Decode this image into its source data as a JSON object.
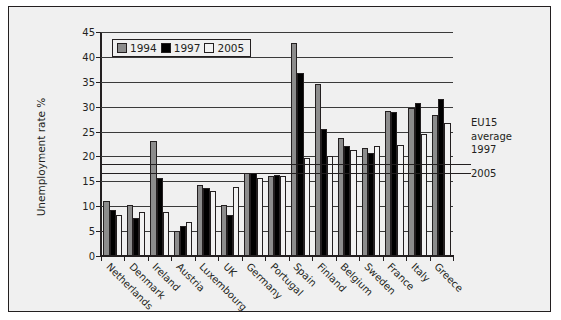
{
  "chart_data": {
    "type": "bar",
    "title": "",
    "xlabel": "",
    "ylabel": "Unemployment rate %",
    "ylim": [
      0,
      45
    ],
    "ytick_step": 5,
    "yticks": [
      0,
      5,
      10,
      15,
      20,
      25,
      30,
      35,
      40,
      45
    ],
    "grid": true,
    "legend_position": "top-left",
    "categories": [
      "Netherlands",
      "Denmark",
      "Ireland",
      "Austria",
      "Luxembourg",
      "UK",
      "Germany",
      "Portugal",
      "Spain",
      "Finland",
      "Belgium",
      "Sweden",
      "France",
      "Italy",
      "Greece"
    ],
    "series": [
      {
        "name": "1994",
        "color": "#8c8c8c",
        "values": [
          11.0,
          10.3,
          23.2,
          5.1,
          14.3,
          10.3,
          16.6,
          16.0,
          42.7,
          34.5,
          23.7,
          21.7,
          29.2,
          29.7,
          28.3
        ]
      },
      {
        "name": "1997",
        "color": "#000000",
        "values": [
          9.2,
          7.7,
          15.6,
          6.0,
          13.6,
          8.2,
          16.7,
          16.2,
          36.8,
          25.6,
          22.1,
          20.7,
          29.0,
          30.8,
          31.5
        ]
      },
      {
        "name": "2005",
        "color": "#f2f2f2",
        "values": [
          8.2,
          8.8,
          8.8,
          6.8,
          13.1,
          13.9,
          15.6,
          16.1,
          19.7,
          20.0,
          21.3,
          22.2,
          22.3,
          24.5,
          26.7
        ]
      }
    ],
    "reference_lines": [
      {
        "label": "EU15 average 1997",
        "value": 16.6
      },
      {
        "label": "2005",
        "value": 18.4
      }
    ],
    "annotations": {
      "eu15_line1": "EU15",
      "eu15_line2": "average",
      "eu15_line3": "1997",
      "eu15_2005": "2005"
    }
  }
}
